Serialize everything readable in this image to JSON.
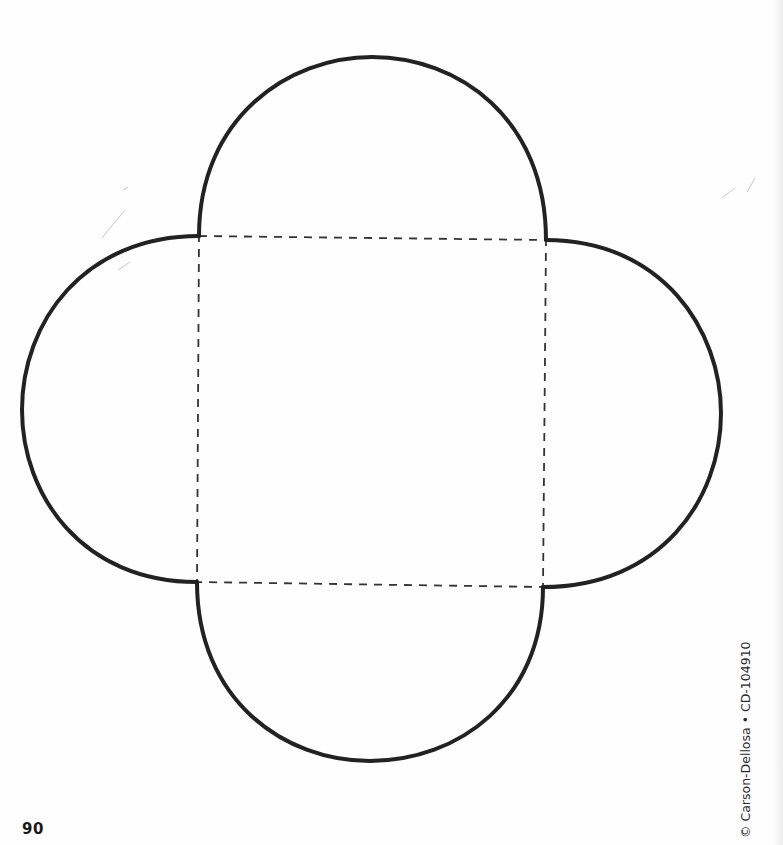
{
  "page": {
    "number": "90",
    "copyright": "© Carson-Dellosa • CD-104910"
  },
  "template": {
    "description": "Envelope template: square center with four semicircular flaps",
    "outline_color": "#222222",
    "fold_line_color": "#333333",
    "square": {
      "top_left": [
        199,
        236
      ],
      "top_right": [
        546,
        240
      ],
      "bottom_right": [
        543,
        587
      ],
      "bottom_left": [
        197,
        582
      ]
    },
    "flaps": [
      "top",
      "right",
      "bottom",
      "left"
    ]
  }
}
